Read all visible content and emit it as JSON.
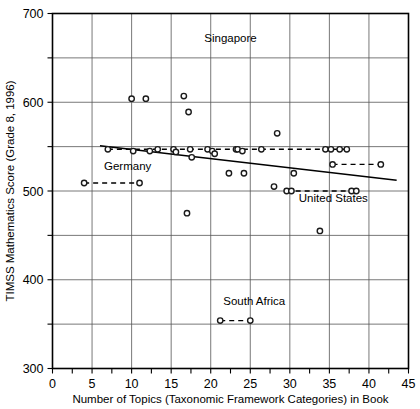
{
  "chart_data": {
    "type": "scatter",
    "title": "",
    "xlabel": "Number of Topics (Taxonomic Framework Categories) in Book",
    "ylabel": "TIMSS Mathematics Score (Grade 8, 1996)",
    "xlim": [
      0,
      45
    ],
    "ylim": [
      300,
      700
    ],
    "xticks": [
      0,
      5,
      10,
      15,
      20,
      25,
      30,
      35,
      40,
      45
    ],
    "yticks": [
      300,
      400,
      500,
      600,
      700
    ],
    "xtick_labels": [
      "0",
      "5",
      "10",
      "15",
      "20",
      "25",
      "30",
      "35",
      "40",
      "45"
    ],
    "ytick_labels": [
      "300",
      "400",
      "500",
      "600",
      "700"
    ],
    "x_gridlines": [
      5,
      10,
      15,
      20,
      25,
      30,
      35,
      40
    ],
    "y_gridlines": [
      350,
      400,
      450,
      500,
      550,
      600,
      650
    ],
    "x_minor_ticks": [
      2.5,
      7.5,
      12.5,
      17.5,
      22.5,
      27.5,
      32.5,
      37.5,
      42.5
    ],
    "y_minor_ticks": [
      350,
      450,
      550,
      650
    ],
    "grid": true,
    "legend": "none",
    "points": [
      {
        "x": 4,
        "y": 509
      },
      {
        "x": 7,
        "y": 547
      },
      {
        "x": 10,
        "y": 604
      },
      {
        "x": 10.2,
        "y": 545
      },
      {
        "x": 11,
        "y": 509
      },
      {
        "x": 11.8,
        "y": 604
      },
      {
        "x": 12.3,
        "y": 545
      },
      {
        "x": 13.3,
        "y": 547
      },
      {
        "x": 15.3,
        "y": 547
      },
      {
        "x": 15.6,
        "y": 544
      },
      {
        "x": 16.6,
        "y": 607
      },
      {
        "x": 17.0,
        "y": 475
      },
      {
        "x": 17.2,
        "y": 589
      },
      {
        "x": 17.4,
        "y": 547
      },
      {
        "x": 17.6,
        "y": 538
      },
      {
        "x": 19.6,
        "y": 547
      },
      {
        "x": 20.2,
        "y": 545
      },
      {
        "x": 20.5,
        "y": 542
      },
      {
        "x": 21.2,
        "y": 354
      },
      {
        "x": 22.3,
        "y": 520
      },
      {
        "x": 23.2,
        "y": 547
      },
      {
        "x": 23.4,
        "y": 547
      },
      {
        "x": 24.0,
        "y": 545
      },
      {
        "x": 24.2,
        "y": 520
      },
      {
        "x": 25.0,
        "y": 354
      },
      {
        "x": 26.4,
        "y": 547
      },
      {
        "x": 28.0,
        "y": 505
      },
      {
        "x": 28.4,
        "y": 565
      },
      {
        "x": 29.6,
        "y": 500
      },
      {
        "x": 30.2,
        "y": 500
      },
      {
        "x": 30.5,
        "y": 520
      },
      {
        "x": 33.8,
        "y": 455
      },
      {
        "x": 34.5,
        "y": 547
      },
      {
        "x": 35.2,
        "y": 547
      },
      {
        "x": 35.4,
        "y": 530
      },
      {
        "x": 36.3,
        "y": 547
      },
      {
        "x": 37.2,
        "y": 547
      },
      {
        "x": 37.8,
        "y": 500
      },
      {
        "x": 38.4,
        "y": 500
      },
      {
        "x": 41.5,
        "y": 530
      }
    ],
    "trendline": {
      "x1": 6.0,
      "y1": 551,
      "x2": 43.5,
      "y2": 512
    },
    "connectors": [
      {
        "label": "Germany",
        "x1": 4,
        "y1": 509,
        "x2": 11,
        "y2": 509
      },
      {
        "label": "South Africa",
        "x1": 21.2,
        "y1": 354,
        "x2": 25.0,
        "y2": 354
      },
      {
        "label": "main-cluster",
        "x1": 7,
        "y1": 547,
        "x2": 37.2,
        "y2": 547
      },
      {
        "label": "mid-550",
        "x1": 35.4,
        "y1": 530,
        "x2": 41.5,
        "y2": 530
      },
      {
        "label": "United States",
        "x1": 29.6,
        "y1": 500,
        "x2": 38.4,
        "y2": 500
      }
    ],
    "annotations": [
      {
        "text": "Singapore",
        "x": 22.5,
        "y": 668,
        "anchor": "middle"
      },
      {
        "text": "Germany",
        "x": 9.5,
        "y": 524,
        "anchor": "middle"
      },
      {
        "text": "United States",
        "x": 35.5,
        "y": 488,
        "anchor": "middle"
      },
      {
        "text": "South Africa",
        "x": 25.5,
        "y": 372,
        "anchor": "middle"
      }
    ]
  },
  "colors": {
    "axis": "#000000",
    "grid": "#555555",
    "marker_stroke": "#1a1a1a",
    "marker_fill": "#ffffff",
    "background": "#ffffff"
  }
}
